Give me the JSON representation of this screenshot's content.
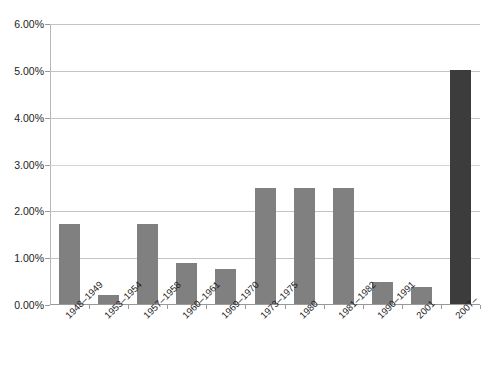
{
  "chart_data": {
    "type": "bar",
    "title": "",
    "xlabel": "",
    "ylabel": "",
    "categories": [
      "1948–1949",
      "1953–1954",
      "1957–1958",
      "1960–1961",
      "1969–1970",
      "1973–1975",
      "1980",
      "1981–1982",
      "1990–1991",
      "2001",
      "2007–"
    ],
    "values": [
      1.7,
      0.2,
      1.7,
      0.88,
      0.75,
      2.47,
      2.47,
      2.47,
      0.47,
      0.37,
      5.0
    ],
    "ylim": [
      0,
      6
    ],
    "ytick_values": [
      0,
      1,
      2,
      3,
      4,
      5,
      6
    ],
    "ytick_labels": [
      "0.00%",
      "1.00%",
      "2.00%",
      "3.00%",
      "4.00%",
      "5.00%",
      "6.00%"
    ],
    "grid": true,
    "legend": "none",
    "bar_color": "#808080",
    "highlight_color": "#3c3c3c",
    "highlight_index": 10
  }
}
